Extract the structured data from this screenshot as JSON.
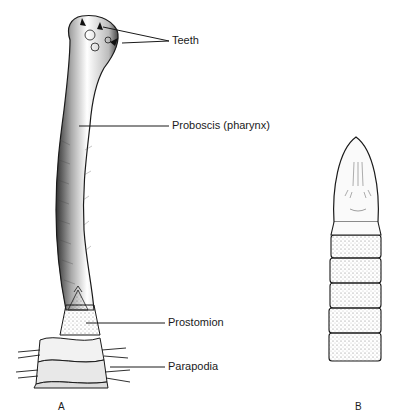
{
  "figure_a": {
    "letter": "A",
    "labels": {
      "teeth": "Teeth",
      "proboscis": "Proboscis (pharynx)",
      "prostomion": "Prostomion",
      "parapodia": "Parapodia"
    }
  },
  "figure_b": {
    "letter": "B",
    "segments": 5
  },
  "colors": {
    "ink": "#1a1a1a",
    "background": "#ffffff",
    "shade": "#555555"
  }
}
